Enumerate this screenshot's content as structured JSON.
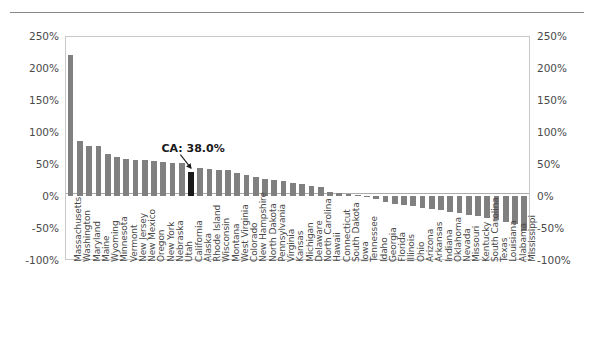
{
  "chart_data": {
    "type": "bar",
    "title": "",
    "subtitle": "",
    "xlabel": "",
    "ylabel": "",
    "ylim": [
      -100,
      250
    ],
    "grid": false,
    "legend": null,
    "y_tick_labels": [
      "250%",
      "200%",
      "150%",
      "100%",
      "50%",
      "0%",
      "-50%",
      "-100%"
    ],
    "y_tick_values": [
      250,
      200,
      150,
      100,
      50,
      0,
      -50,
      -100
    ],
    "dual_axis": true,
    "bar_color": "#808080",
    "highlight_color": "#1a1a1a",
    "highlight_category": "California",
    "annotations": [
      {
        "text": "CA: 38.0%",
        "target": "California"
      }
    ],
    "categories": [
      "Massachusetts",
      "Washington",
      "Maryland",
      "Maine",
      "Wyoming",
      "Minnesota",
      "Vermont",
      "New Jersey",
      "New Mexico",
      "Oregon",
      "New York",
      "Nebraska",
      "Utah",
      "California",
      "Alaska",
      "Rhode Island",
      "Wisconsin",
      "Montana",
      "West Virginia",
      "Colorado",
      "New Hampshire",
      "North Dakota",
      "Pennsylvania",
      "Virginia",
      "Kansas",
      "Michigan",
      "Delaware",
      "North Carolina",
      "Hawaii",
      "Connecticut",
      "South Dakota",
      "Iowa",
      "Tennessee",
      "Idaho",
      "Georgia",
      "Florida",
      "Illinois",
      "Ohio",
      "Arizona",
      "Arkansas",
      "Indiana",
      "Oklahoma",
      "Nevada",
      "Missouri",
      "Kentucky",
      "South Carolina",
      "Texas",
      "Louisiana",
      "Alabama",
      "Mississippi"
    ],
    "values": [
      220.0,
      86.0,
      78.0,
      78.0,
      66.0,
      61.0,
      58.0,
      57.0,
      56.0,
      55.0,
      53.0,
      52.0,
      51.0,
      38.0,
      44.0,
      42.0,
      41.0,
      40.0,
      36.0,
      33.0,
      30.0,
      27.0,
      25.0,
      24.0,
      20.0,
      18.0,
      16.0,
      14.0,
      7.0,
      5.0,
      3.0,
      1.0,
      -2.0,
      -4.0,
      -10.0,
      -12.0,
      -14.0,
      -16.0,
      -18.0,
      -20.0,
      -22.0,
      -25.0,
      -27.0,
      -29.0,
      -31.0,
      -34.0,
      -37.0,
      -40.0,
      -44.0,
      -55.0
    ]
  }
}
